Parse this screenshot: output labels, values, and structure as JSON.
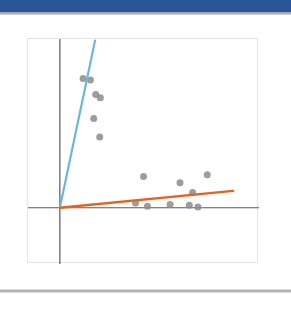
{
  "window": {
    "top_bar_color": "#2a5699",
    "divider_color": "#a9a9a9",
    "canvas_color": "#ffffff"
  },
  "slide": {
    "title": "",
    "body_text": ""
  },
  "chart_data": {
    "type": "scatter",
    "title": "",
    "xlabel": "",
    "ylabel": "",
    "grid": false,
    "legend": "none",
    "xlim": [
      -2.4,
      15.0
    ],
    "ylim": [
      -3.5,
      10.5
    ],
    "axes": {
      "x_axis_y": 0,
      "y_axis_x": 0,
      "axis_color": "#595959",
      "axis_width": 1.2,
      "plot_border_color": "#e4e4e4",
      "background": "#ffffff"
    },
    "series": [
      {
        "name": "cluster-upper",
        "type": "scatter",
        "marker": "circle",
        "color": "#8c8c8c",
        "opacity": 0.85,
        "size": 7,
        "points": [
          {
            "x": 1.75,
            "y": 8.05
          },
          {
            "x": 2.3,
            "y": 7.95
          },
          {
            "x": 2.7,
            "y": 7.05
          },
          {
            "x": 3.05,
            "y": 6.85
          },
          {
            "x": 2.55,
            "y": 5.55
          },
          {
            "x": 3.0,
            "y": 4.4
          }
        ]
      },
      {
        "name": "cluster-lower",
        "type": "scatter",
        "marker": "circle",
        "color": "#8c8c8c",
        "opacity": 0.85,
        "size": 7,
        "points": [
          {
            "x": 6.3,
            "y": 1.95
          },
          {
            "x": 9.05,
            "y": 1.55
          },
          {
            "x": 11.1,
            "y": 2.05
          },
          {
            "x": 10.0,
            "y": 0.95
          },
          {
            "x": 5.7,
            "y": 0.3
          },
          {
            "x": 6.6,
            "y": 0.1
          },
          {
            "x": 8.3,
            "y": 0.2
          },
          {
            "x": 9.75,
            "y": 0.15
          },
          {
            "x": 10.4,
            "y": 0.05
          }
        ]
      },
      {
        "name": "line-blue-steep",
        "type": "line",
        "color": "#6bb8d6",
        "width": 2.2,
        "from": {
          "x": 0.0,
          "y": 0.0
        },
        "to": {
          "x": 2.65,
          "y": 10.4
        }
      },
      {
        "name": "line-orange-shallow",
        "type": "line",
        "color": "#e8621f",
        "width": 2.4,
        "from": {
          "x": 0.0,
          "y": 0.0
        },
        "to": {
          "x": 13.05,
          "y": 1.05
        }
      }
    ]
  }
}
